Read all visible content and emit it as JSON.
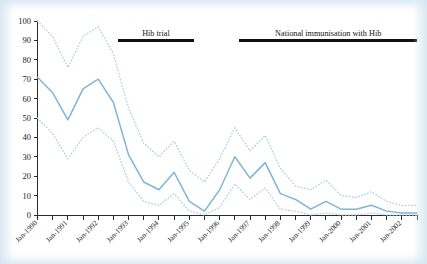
{
  "chart_data": {
    "type": "line",
    "title": "",
    "subtitle": "",
    "xlabel": "",
    "ylabel": "",
    "ylim": [
      0,
      100
    ],
    "yticks": [
      0,
      10,
      20,
      30,
      40,
      50,
      60,
      70,
      80,
      90,
      100
    ],
    "grid": false,
    "legend_position": "none",
    "x_tick_labels": [
      "Jan-1990",
      "Jan-1991",
      "Jan-1992",
      "Jan-1993",
      "Jan-1994",
      "Jan-1995",
      "Jan-1996",
      "Jan-1997",
      "Jan-1998",
      "Jan-1999",
      "Jan-2000",
      "Jan-2001",
      "Jan-2002"
    ],
    "x": [
      1990.0,
      1990.5,
      1991.0,
      1991.5,
      1992.0,
      1992.5,
      1993.0,
      1993.5,
      1994.0,
      1994.5,
      1995.0,
      1995.5,
      1996.0,
      1996.5,
      1997.0,
      1997.5,
      1998.0,
      1998.5,
      1999.0,
      1999.5,
      2000.0,
      2000.5,
      2001.0,
      2001.5,
      2002.0,
      2002.5
    ],
    "series": [
      {
        "name": "Upper 95% confidence limit",
        "style": "dotted",
        "color": "#a8cfe4",
        "values": [
          100,
          92,
          76,
          92,
          97,
          83,
          55,
          37,
          30,
          38,
          23,
          17,
          29,
          45,
          33,
          41,
          24,
          15,
          13,
          18,
          10,
          9,
          12,
          7,
          5,
          5
        ]
      },
      {
        "name": "Incidence rate",
        "style": "solid",
        "color": "#7fb6d6",
        "values": [
          71,
          63,
          49,
          65,
          70,
          58,
          31,
          17,
          13,
          22,
          7,
          2,
          13,
          30,
          19,
          27,
          11,
          8,
          3,
          7,
          3,
          3,
          5,
          2,
          1,
          1
        ]
      },
      {
        "name": "Lower 95% confidence limit",
        "style": "dotted",
        "color": "#a8cfe4",
        "values": [
          50,
          42,
          29,
          40,
          45,
          38,
          17,
          7,
          5,
          11,
          2,
          0,
          4,
          16,
          8,
          14,
          3,
          2,
          0,
          1,
          0,
          0,
          1,
          0,
          0,
          0
        ]
      }
    ],
    "annotations": [
      {
        "label": "Hib trial",
        "x_start": 1992.65,
        "x_end": 1995.15,
        "y": 90,
        "bar_color": "#111111"
      },
      {
        "label": "National immunisation with Hib",
        "x_start": 1996.65,
        "x_end": 2002.5,
        "y": 90,
        "bar_color": "#111111"
      }
    ]
  },
  "figure": {
    "background_color": "#ffffff",
    "axis_color": "#2b2b2b",
    "main_series_color": "#7fb6d6",
    "ci_series_color": "#a8cfe4",
    "annotation_color": "#111111"
  }
}
